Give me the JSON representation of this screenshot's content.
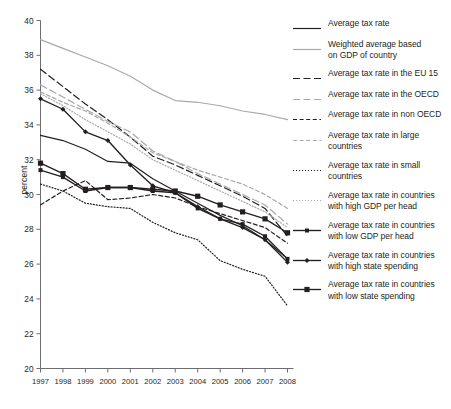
{
  "chart_data": {
    "type": "line",
    "title": "",
    "xlabel": "",
    "ylabel": "percent",
    "x": [
      1997,
      1998,
      1999,
      2000,
      2001,
      2002,
      2003,
      2004,
      2005,
      2006,
      2007,
      2008
    ],
    "categories": [
      "1997",
      "1998",
      "1999",
      "2000",
      "2001",
      "2002",
      "2003",
      "2004",
      "2005",
      "2006",
      "2007",
      "2008"
    ],
    "xlim": [
      1997,
      2008
    ],
    "ylim": [
      20,
      40
    ],
    "yticks": [
      20,
      22,
      24,
      26,
      28,
      30,
      32,
      34,
      36,
      38,
      40
    ],
    "grid": false,
    "legend_position": "right",
    "series": [
      {
        "name": "Average tax rate",
        "style": "solid",
        "color": "#231f20",
        "marker": "none",
        "values": [
          33.4,
          33.1,
          32.6,
          31.9,
          31.8,
          30.9,
          30.2,
          29.5,
          28.8,
          28.2,
          27.4,
          26.3
        ]
      },
      {
        "name": "Weighted average based on GDP of country",
        "style": "solid",
        "color": "#a7a9ac",
        "marker": "none",
        "values": [
          38.9,
          38.4,
          37.9,
          37.4,
          36.8,
          36.0,
          35.4,
          35.3,
          35.1,
          34.8,
          34.6,
          34.3
        ]
      },
      {
        "name": "Average tax rate in the EU 15",
        "style": "long-dash",
        "color": "#231f20",
        "marker": "none",
        "values": [
          37.2,
          36.2,
          35.2,
          34.3,
          33.3,
          32.2,
          31.7,
          31.1,
          30.5,
          29.9,
          29.2,
          27.6
        ]
      },
      {
        "name": "Average tax rate in the OECD",
        "style": "long-dash",
        "color": "#a7a9ac",
        "marker": "none",
        "values": [
          36.3,
          35.6,
          34.9,
          34.2,
          33.6,
          32.5,
          31.9,
          31.2,
          30.6,
          30.0,
          29.4,
          28.3
        ]
      },
      {
        "name": "Average tax rate in non OECD",
        "style": "dash",
        "color": "#231f20",
        "marker": "none",
        "values": [
          29.4,
          30.2,
          30.8,
          29.7,
          29.8,
          30.0,
          29.8,
          29.3,
          28.9,
          28.5,
          28.1,
          27.2
        ]
      },
      {
        "name": "Average tax rate in large countries",
        "style": "dash",
        "color": "#a7a9ac",
        "marker": "none",
        "values": [
          35.9,
          35.3,
          34.8,
          34.1,
          33.3,
          32.4,
          31.9,
          31.4,
          31.0,
          30.6,
          30.0,
          29.2
        ]
      },
      {
        "name": "Average tax rate in small countries",
        "style": "dot",
        "color": "#231f20",
        "marker": "none",
        "values": [
          30.6,
          30.2,
          29.5,
          29.3,
          29.2,
          28.4,
          27.8,
          27.4,
          26.2,
          25.7,
          25.3,
          23.6
        ]
      },
      {
        "name": "Average tax rate in countries with high GDP per head",
        "style": "dot",
        "color": "#a7a9ac",
        "marker": "none",
        "values": [
          35.8,
          35.1,
          34.3,
          33.6,
          32.9,
          32.0,
          31.4,
          30.8,
          30.2,
          29.6,
          29.0,
          28.1
        ]
      },
      {
        "name": "Average tax rate in countries with low GDP per head",
        "style": "solid",
        "color": "#231f20",
        "marker": "square-small",
        "values": [
          31.4,
          31.0,
          30.2,
          30.4,
          30.4,
          30.2,
          30.1,
          29.2,
          28.6,
          28.3,
          27.6,
          26.3
        ]
      },
      {
        "name": "Average tax rate in countries with high state spending",
        "style": "solid",
        "color": "#231f20",
        "marker": "diamond",
        "values": [
          35.5,
          34.9,
          33.6,
          33.1,
          31.7,
          30.5,
          30.1,
          29.3,
          28.6,
          28.1,
          27.4,
          26.1
        ]
      },
      {
        "name": "Average tax rate in countries with low state spending",
        "style": "solid",
        "color": "#231f20",
        "marker": "square",
        "values": [
          31.8,
          31.2,
          30.3,
          30.4,
          30.4,
          30.3,
          30.2,
          29.9,
          29.4,
          29.0,
          28.6,
          27.8
        ]
      }
    ]
  },
  "legend": {
    "items": [
      {
        "label": "Average tax rate",
        "style": "solid",
        "color": "#231f20",
        "marker": "none"
      },
      {
        "label": "Weighted average based\non GDP of country",
        "style": "solid",
        "color": "#a7a9ac",
        "marker": "none"
      },
      {
        "label": "Average tax rate in the EU 15",
        "style": "long-dash",
        "color": "#231f20",
        "marker": "none"
      },
      {
        "label": "Average tax rate in the OECD",
        "style": "long-dash",
        "color": "#a7a9ac",
        "marker": "none"
      },
      {
        "label": "Average tax rate in non OECD",
        "style": "dash",
        "color": "#231f20",
        "marker": "none"
      },
      {
        "label": "Average tax rate in large\ncountries",
        "style": "dash",
        "color": "#a7a9ac",
        "marker": "none"
      },
      {
        "label": "Average tax rate in small\ncountries",
        "style": "dot",
        "color": "#231f20",
        "marker": "none"
      },
      {
        "label": "Average tax rate in countries\nwith high GDP per head",
        "style": "dot",
        "color": "#a7a9ac",
        "marker": "none"
      },
      {
        "label": "Average tax rate in countries\nwith low GDP per head",
        "style": "solid",
        "color": "#231f20",
        "marker": "square-small"
      },
      {
        "label": "Average tax rate in countries\nwith high state spending",
        "style": "solid",
        "color": "#231f20",
        "marker": "diamond"
      },
      {
        "label": "Average tax rate in countries\nwith low state spending",
        "style": "solid",
        "color": "#231f20",
        "marker": "square"
      }
    ]
  }
}
